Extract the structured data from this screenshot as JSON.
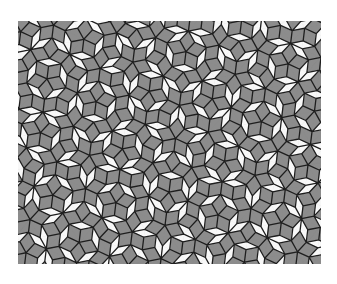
{
  "image": {
    "subject": "Penrose rhombus tiling (P3)",
    "width": 337,
    "height": 284,
    "background": "#ffffff"
  },
  "tiling": {
    "frame": {
      "x": 18,
      "y": 21,
      "width": 303,
      "height": 243
    },
    "edge_length": 14,
    "colors": {
      "thick_rhombus": "#8c8c8c",
      "thin_rhombus": "#f8f8f8",
      "edge_line": "#1e1e1e"
    },
    "line_width": 1.3
  }
}
